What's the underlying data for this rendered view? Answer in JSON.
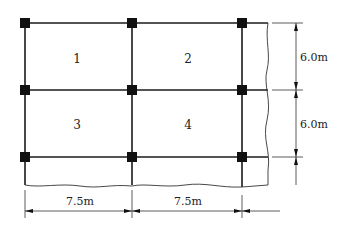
{
  "diagram": {
    "type": "structural-floor-plan-grid",
    "panels": [
      {
        "id": "1",
        "label": "1"
      },
      {
        "id": "2",
        "label": "2"
      },
      {
        "id": "3",
        "label": "3"
      },
      {
        "id": "4",
        "label": "4"
      }
    ],
    "dimensions": {
      "span_x": [
        "7.5m",
        "7.5m"
      ],
      "span_y": [
        "6.0m",
        "6.0m"
      ]
    },
    "columns": 9,
    "line_color": "#1a1a1a"
  }
}
